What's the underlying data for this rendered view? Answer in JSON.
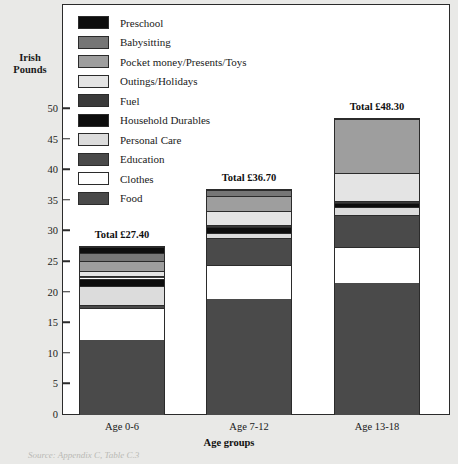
{
  "chart_data": {
    "type": "bar",
    "subtype": "stacked-vertical",
    "title": "",
    "xlabel": "Age groups",
    "ylabel": "Irish Pounds",
    "categories": [
      "Age 0-6",
      "Age 7-12",
      "Age 13-18"
    ],
    "ylim": [
      0,
      52
    ],
    "yticks": [
      0,
      5,
      10,
      15,
      20,
      25,
      30,
      35,
      40,
      45,
      50
    ],
    "ytick_labels": [
      "0",
      "5",
      "10",
      "15",
      "20",
      "25",
      "30",
      "35",
      "40",
      "45",
      "50"
    ],
    "grid": false,
    "legend_position": "top-left-inside",
    "totals": [
      "Total £27.40",
      "Total £36.70",
      "Total £48.30"
    ],
    "total_values": [
      27.4,
      36.7,
      48.3
    ],
    "series": [
      {
        "name": "Food",
        "color": "#4a4a4a",
        "values": [
          12.3,
          19.0,
          21.5
        ]
      },
      {
        "name": "Clothes",
        "color": "#ffffff",
        "values": [
          5.1,
          5.5,
          6.0
        ]
      },
      {
        "name": "Education",
        "color": "#4a4a4a",
        "values": [
          0.6,
          4.4,
          5.2
        ]
      },
      {
        "name": "Personal Care",
        "color": "#dcdcdc",
        "values": [
          3.1,
          0.9,
          1.3
        ]
      },
      {
        "name": "Household Durables",
        "color": "#0d0d0d",
        "values": [
          1.2,
          0.9,
          0.7
        ]
      },
      {
        "name": "Fuel",
        "color": "#3a3a3a",
        "values": [
          0.4,
          0.3,
          0.3
        ]
      },
      {
        "name": "Outings/Holidays",
        "color": "#e4e4e4",
        "values": [
          0.8,
          2.4,
          4.6
        ]
      },
      {
        "name": "Pocket money/Presents/Toys",
        "color": "#9e9e9e",
        "values": [
          1.7,
          2.4,
          8.7
        ]
      },
      {
        "name": "Babysitting",
        "color": "#767676",
        "values": [
          1.3,
          0.9,
          0.0
        ]
      },
      {
        "name": "Preschool",
        "color": "#0d0d0d",
        "values": [
          0.9,
          0.0,
          0.0
        ]
      }
    ]
  },
  "legend": {
    "items": [
      {
        "label": "Preschool",
        "color": "#0d0d0d"
      },
      {
        "label": "Babysitting",
        "color": "#767676"
      },
      {
        "label": "Pocket money/Presents/Toys",
        "color": "#9e9e9e"
      },
      {
        "label": "Outings/Holidays",
        "color": "#e4e4e4"
      },
      {
        "label": "Fuel",
        "color": "#3a3a3a"
      },
      {
        "label": "Household Durables",
        "color": "#0d0d0d"
      },
      {
        "label": "Personal Care",
        "color": "#dcdcdc"
      },
      {
        "label": "Education",
        "color": "#4a4a4a"
      },
      {
        "label": "Clothes",
        "color": "#ffffff"
      },
      {
        "label": "Food",
        "color": "#4a4a4a"
      }
    ]
  },
  "source_caption": "Source: Appendix C, Table C.3"
}
